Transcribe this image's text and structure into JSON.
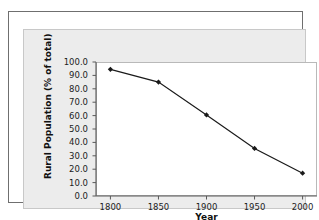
{
  "figure": {
    "frame_color": "#6f6f6f",
    "panel_color": "#ececec",
    "plot_background": "#ffffff",
    "series_color": "#1a1a1a"
  },
  "chart_data": {
    "type": "line",
    "title": "",
    "xlabel": "Year",
    "ylabel": "Rural Population (% of total)",
    "x": [
      1800,
      1850,
      1900,
      1950,
      2000
    ],
    "values": [
      94.5,
      85.0,
      60.5,
      35.5,
      17.0
    ],
    "series": [
      {
        "name": "Rural Population",
        "values": [
          94.5,
          85.0,
          60.5,
          35.5,
          17.0
        ]
      }
    ],
    "xlim": [
      1785,
      2015
    ],
    "ylim": [
      0,
      100
    ],
    "xticks": [
      1800,
      1850,
      1900,
      1950,
      2000
    ],
    "xticklabels": [
      "1800",
      "1850",
      "1900",
      "1950",
      "2000"
    ],
    "yticks": [
      0,
      10,
      20,
      30,
      40,
      50,
      60,
      70,
      80,
      90,
      100
    ],
    "yticklabels": [
      "0.0",
      "10.0",
      "20.0",
      "30.0",
      "40.0",
      "50.0",
      "60.0",
      "70.0",
      "80.0",
      "90.0",
      "100.0"
    ],
    "grid": false,
    "legend": false,
    "marker": "diamond"
  }
}
